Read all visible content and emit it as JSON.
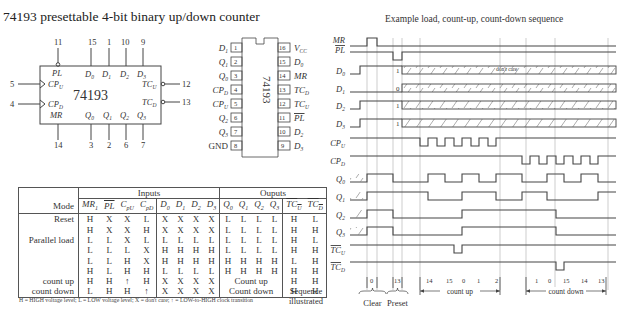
{
  "title": "74193 presettable 4-bit binary up/down counter",
  "logic_symbol": {
    "chip_name": "74193",
    "top_pins": [
      {
        "name": "PL",
        "overbar": false,
        "bubble": true,
        "pin": "11"
      },
      {
        "name": "D0",
        "pin": "15"
      },
      {
        "name": "D1",
        "pin": "1"
      },
      {
        "name": "D2",
        "pin": "10"
      },
      {
        "name": "D3",
        "pin": "9"
      }
    ],
    "left_pins": [
      {
        "name": "CPU",
        "pin": "5",
        "clock": true
      },
      {
        "name": "CPD",
        "pin": "4",
        "clock": true
      }
    ],
    "right_pins": [
      {
        "name": "TCU",
        "pin": "12",
        "bubble": true
      },
      {
        "name": "TCD",
        "pin": "13",
        "bubble": true
      }
    ],
    "bottom_pins": [
      {
        "name": "MR",
        "pin": "14"
      },
      {
        "name": "Q0",
        "pin": "3"
      },
      {
        "name": "Q1",
        "pin": "2"
      },
      {
        "name": "Q2",
        "pin": "6"
      },
      {
        "name": "Q3",
        "pin": "7"
      }
    ]
  },
  "dip_package": {
    "chip_name": "74193",
    "left": [
      {
        "pin": "1",
        "name": "D1"
      },
      {
        "pin": "2",
        "name": "Q1"
      },
      {
        "pin": "3",
        "name": "Q0"
      },
      {
        "pin": "4",
        "name": "CPD"
      },
      {
        "pin": "5",
        "name": "CPU"
      },
      {
        "pin": "6",
        "name": "Q2"
      },
      {
        "pin": "7",
        "name": "Q3"
      },
      {
        "pin": "8",
        "name": "GND"
      }
    ],
    "right": [
      {
        "pin": "16",
        "name": "VCC"
      },
      {
        "pin": "15",
        "name": "D0"
      },
      {
        "pin": "14",
        "name": "MR"
      },
      {
        "pin": "13",
        "name": "TCD"
      },
      {
        "pin": "12",
        "name": "TCU"
      },
      {
        "pin": "11",
        "name": "PL",
        "overbar": true
      },
      {
        "pin": "10",
        "name": "D2"
      },
      {
        "pin": "9",
        "name": "D3"
      }
    ]
  },
  "truth_table": {
    "group_headers": {
      "inputs": "Inputs",
      "outputs": "Ouputs"
    },
    "mode_header": "Mode",
    "columns": [
      "MR1",
      "PL",
      "CpU",
      "CpD",
      "D0",
      "D1",
      "D2",
      "D3",
      "Q0",
      "Q1",
      "Q2",
      "Q3",
      "TCU",
      "TCD"
    ],
    "rows": [
      {
        "mode": "Reset",
        "inputs": [
          "H",
          "X",
          "X",
          "L",
          "X",
          "X",
          "X",
          "X"
        ],
        "outputs": [
          "L",
          "L",
          "L",
          "L"
        ],
        "tc": [
          "H",
          "L"
        ]
      },
      {
        "mode": "",
        "inputs": [
          "H",
          "X",
          "X",
          "H",
          "X",
          "X",
          "X",
          "X"
        ],
        "outputs": [
          "L",
          "L",
          "L",
          "L"
        ],
        "tc": [
          "H",
          "H"
        ]
      },
      {
        "mode": "Parallel load",
        "inputs": [
          "L",
          "L",
          "X",
          "L",
          "L",
          "L",
          "L",
          "L"
        ],
        "outputs": [
          "L",
          "L",
          "L",
          "L"
        ],
        "tc": [
          "H",
          "L"
        ]
      },
      {
        "mode": "",
        "inputs": [
          "L",
          "L",
          "L",
          "X",
          "H",
          "H",
          "H",
          "H"
        ],
        "outputs": [
          "L",
          "L",
          "L",
          "L"
        ],
        "tc": [
          "H",
          "H"
        ]
      },
      {
        "mode": "",
        "inputs": [
          "L",
          "L",
          "H",
          "X",
          "H",
          "H",
          "H",
          "H"
        ],
        "outputs": [
          "H",
          "H",
          "H",
          "H"
        ],
        "tc": [
          "L",
          "H"
        ]
      },
      {
        "mode": "",
        "inputs": [
          "H",
          "L",
          "H",
          "H",
          "L",
          "L",
          "L",
          "L"
        ],
        "outputs": [
          "H",
          "H",
          "H",
          "H"
        ],
        "tc": [
          "H",
          "H"
        ]
      },
      {
        "mode": "count up",
        "inputs": [
          "H",
          "H",
          "↑",
          "H",
          "X",
          "X",
          "X",
          "X"
        ],
        "outputs_span": "Count up",
        "tc": [
          "H",
          "H"
        ]
      },
      {
        "mode": "count down",
        "inputs": [
          "L",
          "H",
          "H",
          "↑",
          "X",
          "X",
          "X",
          "X"
        ],
        "outputs_span": "Count down",
        "tc": [
          "H",
          "H"
        ]
      }
    ],
    "legend": "H = HIGH voltage level; L = LOW voltage level; X = don't care; ↑ = LOW-to-HIGH clock transition"
  },
  "timing": {
    "title": "Example load, count-up, count-down sequence",
    "signals": [
      "MR",
      "PL",
      "D0",
      "D1",
      "D2",
      "D3",
      "CPU",
      "CPD",
      "Q0",
      "Q1",
      "Q2",
      "Q3",
      "TCU",
      "TCD"
    ],
    "load_values": [
      "1",
      "0",
      "1",
      "1"
    ],
    "dont_care_label": "don't care",
    "sequence_label": "Sequence illustrated",
    "sequence_values": {
      "clear": [
        "0"
      ],
      "preset": [
        "13"
      ],
      "count_up": [
        "14",
        "15",
        "0",
        "1",
        "2"
      ],
      "count_down": [
        "1",
        "0",
        "15",
        "14",
        "13"
      ]
    },
    "brackets": {
      "clear": "Clear",
      "preset": "Preset",
      "count_up": "count up",
      "count_down": "count down"
    }
  }
}
